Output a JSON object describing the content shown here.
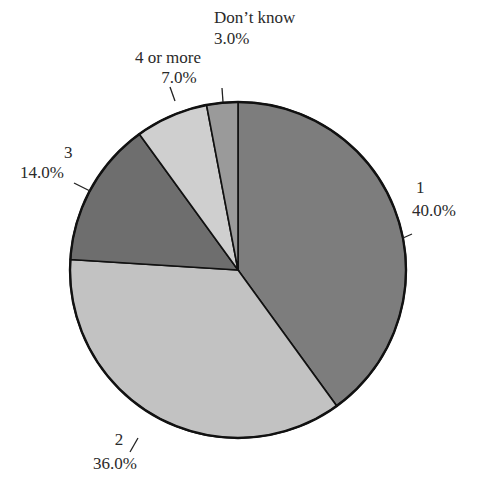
{
  "chart_data": {
    "type": "pie",
    "title": "",
    "start_angle": "12 o'clock",
    "direction": "clockwise",
    "categories": [
      "1",
      "2",
      "3",
      "4 or more",
      "Don’t know"
    ],
    "values": [
      40.0,
      36.0,
      14.0,
      7.0,
      3.0
    ],
    "value_labels": [
      "40.0%",
      "36.0%",
      "14.0%",
      "7.0%",
      "3.0%"
    ],
    "colors": [
      "#7d7d7d",
      "#c2c2c2",
      "#6e6e6e",
      "#cfcfcf",
      "#9a9a9a"
    ],
    "legend": "none (labels with leader lines)"
  },
  "labels": {
    "s1": {
      "name": "1",
      "pct": "40.0%"
    },
    "s2": {
      "name": "2",
      "pct": "36.0%"
    },
    "s3": {
      "name": "3",
      "pct": "14.0%"
    },
    "s4": {
      "name": "4 or more",
      "pct": "7.0%"
    },
    "s5": {
      "name": "Don’t know",
      "pct": "3.0%"
    }
  }
}
